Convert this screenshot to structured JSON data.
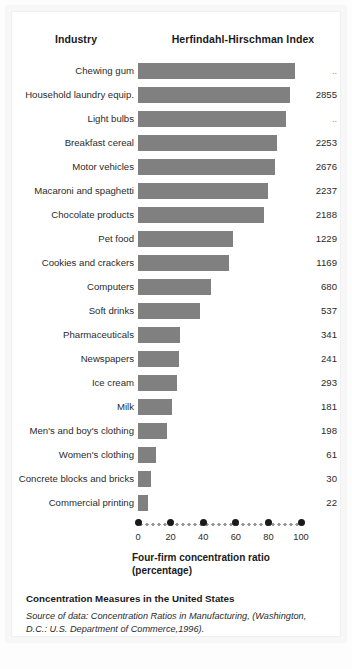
{
  "header": {
    "industry_label": "Industry",
    "hhi_label": "Herfindahl-Hirschman Index"
  },
  "axis": {
    "title_line1": "Four-firm concentration ratio",
    "title_line2": "(percentage)",
    "ticks": [
      "0",
      "20",
      "40",
      "60",
      "80",
      "100"
    ]
  },
  "caption": {
    "title": "Concentration Measures in the United States",
    "source": "Source of data: Concentration Ratios in Manufacturing, (Washington, D.C.: U.S. Department of Commerce,1996)."
  },
  "colors": {
    "bar": "#808080",
    "text": "#2b2b2b",
    "frame": "#efefef"
  },
  "chart_data": {
    "type": "bar",
    "title": "Concentration Measures in the United States",
    "xlabel": "Four-firm concentration ratio (percentage)",
    "ylabel": "Industry",
    "xlim": [
      0,
      100
    ],
    "grid": false,
    "legend": null,
    "orientation": "horizontal",
    "value_column_header": "Herfindahl-Hirschman Index",
    "categories": [
      "Chewing gum",
      "Household laundry equip.",
      "Light bulbs",
      "Breakfast cereal",
      "Motor vehicles",
      "Macaroni and spaghetti",
      "Chocolate products",
      "Pet food",
      "Cookies and crackers",
      "Computers",
      "Soft drinks",
      "Pharmaceuticals",
      "Newspapers",
      "Ice cream",
      "Milk",
      "Men's and boy's clothing",
      "Women's clothing",
      "Concrete blocks and bricks",
      "Commercial printing"
    ],
    "values": [
      96,
      93,
      91,
      85,
      84,
      80,
      77,
      58,
      56,
      45,
      38,
      26,
      25,
      24,
      21,
      18,
      11,
      8,
      6
    ],
    "hhi": [
      "..",
      "2855",
      "..",
      "2253",
      "2676",
      "2237",
      "2188",
      "1229",
      "1169",
      "680",
      "537",
      "341",
      "241",
      "293",
      "181",
      "198",
      "61",
      "30",
      "22"
    ],
    "rows": [
      {
        "industry": "Chewing gum",
        "ratio": 96,
        "hhi": ".."
      },
      {
        "industry": "Household laundry equip.",
        "ratio": 93,
        "hhi": "2855"
      },
      {
        "industry": "Light bulbs",
        "ratio": 91,
        "hhi": ".."
      },
      {
        "industry": "Breakfast cereal",
        "ratio": 85,
        "hhi": "2253"
      },
      {
        "industry": "Motor vehicles",
        "ratio": 84,
        "hhi": "2676"
      },
      {
        "industry": "Macaroni and spaghetti",
        "ratio": 80,
        "hhi": "2237"
      },
      {
        "industry": "Chocolate products",
        "ratio": 77,
        "hhi": "2188"
      },
      {
        "industry": "Pet food",
        "ratio": 58,
        "hhi": "1229"
      },
      {
        "industry": "Cookies and crackers",
        "ratio": 56,
        "hhi": "1169"
      },
      {
        "industry": "Computers",
        "ratio": 45,
        "hhi": "680"
      },
      {
        "industry": "Soft drinks",
        "ratio": 38,
        "hhi": "537"
      },
      {
        "industry": "Pharmaceuticals",
        "ratio": 26,
        "hhi": "341"
      },
      {
        "industry": "Newspapers",
        "ratio": 25,
        "hhi": "241"
      },
      {
        "industry": "Ice cream",
        "ratio": 24,
        "hhi": "293"
      },
      {
        "industry": "Milk",
        "ratio": 21,
        "hhi": "181"
      },
      {
        "industry": "Men's and boy's clothing",
        "ratio": 18,
        "hhi": "198"
      },
      {
        "industry": "Women's clothing",
        "ratio": 11,
        "hhi": "61"
      },
      {
        "industry": "Concrete blocks and bricks",
        "ratio": 8,
        "hhi": "30"
      },
      {
        "industry": "Commercial printing",
        "ratio": 6,
        "hhi": "22"
      }
    ]
  }
}
